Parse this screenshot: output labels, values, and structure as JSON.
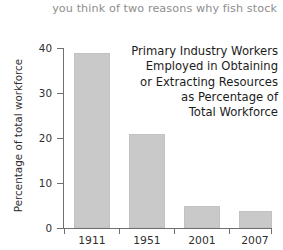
{
  "header": {
    "running_text": "you think of two reasons why fish stock"
  },
  "chart_data": {
    "type": "bar",
    "title": "Primary Industry Workers Employed in Obtaining or Extracting Resources as Percentage of Total Workforce",
    "title_lines": [
      "Primary Industry Workers",
      "Employed in Obtaining",
      "or Extracting Resources",
      "as Percentage of",
      "Total Workforce"
    ],
    "categories": [
      "1911",
      "1951",
      "2001",
      "2007"
    ],
    "values": [
      39,
      21,
      5,
      3.8
    ],
    "xlabel": "",
    "ylabel": "Percentage of total workforce",
    "ylim": [
      0,
      40
    ],
    "yticks": [
      0,
      10,
      20,
      30,
      40
    ],
    "ytick_labels": [
      "0",
      "10",
      "20",
      "30",
      "40"
    ],
    "grid": false,
    "legend": false,
    "bar_color": "#c9c9c9",
    "axis_color": "#6f6f6f",
    "text_color": "#2f2f2f"
  }
}
